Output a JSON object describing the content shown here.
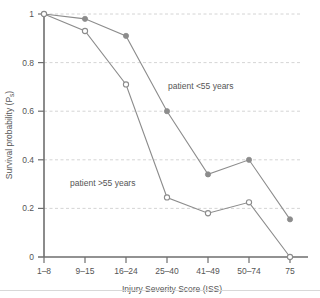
{
  "chart_data": {
    "type": "line",
    "title": "",
    "xlabel": "Injury Severity Score (ISS)",
    "ylabel_main": "Survival probability (P",
    "ylabel_sub": "s",
    "ylabel_close": ")",
    "ylabel_full": "Survival probability (Ps)",
    "categories": [
      "1–8",
      "9–15",
      "16–24",
      "25–40",
      "41–49",
      "50–74",
      "75"
    ],
    "ylim": [
      0,
      1
    ],
    "xlim_categories": 7,
    "yticks": [
      0,
      0.2,
      0.4,
      0.6,
      0.8,
      1
    ],
    "ytick_labels": [
      "0",
      "0.2",
      "0.4",
      "0.6",
      "0.8",
      "1"
    ],
    "grid": true,
    "grid_style": "dashed-horizontal",
    "legend_position": "inline-annotations",
    "series": [
      {
        "name": "patient <55 years",
        "marker": "filled-circle",
        "color": "#8c8c8c",
        "values": [
          1.0,
          0.98,
          0.91,
          0.6,
          0.34,
          0.4,
          0.155
        ]
      },
      {
        "name": "patient >55 years",
        "marker": "open-circle",
        "color": "#8c8c8c",
        "values": [
          1.0,
          0.93,
          0.71,
          0.245,
          0.18,
          0.225,
          0.0
        ]
      }
    ],
    "annotations": [
      {
        "text": "patient <55 years",
        "x_px": 168,
        "y_px": 86
      },
      {
        "text": "patient >55 years",
        "x_px": 70,
        "y_px": 183
      }
    ]
  },
  "colors": {
    "line": "#8c8c8c",
    "axis": "#6e6e6e",
    "grid": "#c9c9c9",
    "text": "#555555",
    "background": "#ffffff",
    "rule": "#d8d8d8"
  }
}
